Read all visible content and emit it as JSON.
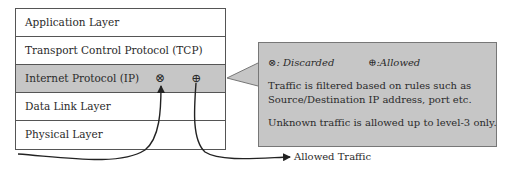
{
  "diagram": {
    "layers": [
      {
        "label": "Application Layer",
        "shaded": false
      },
      {
        "label": "Transport Control Protocol (TCP)",
        "shaded": false
      },
      {
        "label": "Internet Protocol (IP)",
        "shaded": true
      },
      {
        "label": "Data Link Layer",
        "shaded": false
      },
      {
        "label": "Physical Layer",
        "shaded": false
      }
    ],
    "ip_icons": {
      "discarded": "⊗",
      "allowed": "⊕"
    },
    "callout": {
      "legend_discarded": "⊗: Discarded",
      "legend_allowed": "⊕:Allowed",
      "line1": "Traffic is filtered based on rules such as",
      "line2": "Source/Destination IP address, port etc.",
      "line3": "Unknown traffic is allowed up to level-3 only."
    },
    "output_label": "Allowed Traffic",
    "colors": {
      "shade": "#c6c6c6",
      "border": "#555555",
      "line": "#222222"
    }
  }
}
